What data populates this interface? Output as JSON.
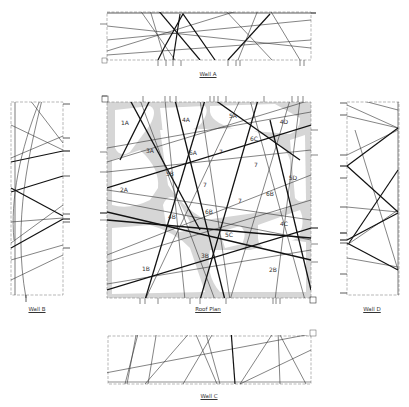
{
  "drawing": {
    "type": "architectural elevation and roof plan",
    "background": "#ffffff",
    "line_color": "#222222",
    "fill_shading": "#cfcfcf"
  },
  "labels": {
    "wall_a": "Wall A",
    "wall_b": "Wall B",
    "wall_c": "Wall C",
    "wall_d": "Wall D",
    "roof_plan": "Roof Plan"
  },
  "zones": [
    {
      "id": "1A",
      "x": 125,
      "y": 122
    },
    {
      "id": "4A",
      "x": 186,
      "y": 119
    },
    {
      "id": "5A",
      "x": 233,
      "y": 115
    },
    {
      "id": "4D",
      "x": 284,
      "y": 121
    },
    {
      "id": "3A",
      "x": 150,
      "y": 150
    },
    {
      "id": "6A",
      "x": 193,
      "y": 152
    },
    {
      "id": "6C",
      "x": 254,
      "y": 138
    },
    {
      "id": "7",
      "x": 221,
      "y": 151
    },
    {
      "id": "7 ",
      "x": 256,
      "y": 164
    },
    {
      "id": "5D",
      "x": 293,
      "y": 177
    },
    {
      "id": "2A",
      "x": 124,
      "y": 189
    },
    {
      "id": "5B",
      "x": 170,
      "y": 173
    },
    {
      "id": "7  ",
      "x": 205,
      "y": 184
    },
    {
      "id": "6B",
      "x": 270,
      "y": 193
    },
    {
      "id": "7   ",
      "x": 240,
      "y": 200
    },
    {
      "id": "4B",
      "x": 172,
      "y": 216
    },
    {
      "id": "6B ",
      "x": 209,
      "y": 211
    },
    {
      "id": "4C",
      "x": 284,
      "y": 223
    },
    {
      "id": "5C",
      "x": 229,
      "y": 234
    },
    {
      "id": "3B",
      "x": 205,
      "y": 255
    },
    {
      "id": "1B",
      "x": 146,
      "y": 268
    },
    {
      "id": "2B",
      "x": 273,
      "y": 269
    }
  ]
}
